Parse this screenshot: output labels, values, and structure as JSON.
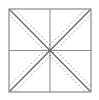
{
  "figure": {
    "canvas": {
      "width": 99,
      "height": 100,
      "background": "#ffffff"
    },
    "colors": {
      "border": "#8a8a8a",
      "center_lines": "#8f8f8f",
      "diagonal_solid": "#6e6e6e",
      "diagonal_dashed": "#9a9a9a",
      "background": "#ffffff"
    },
    "square": {
      "label": "outer-square",
      "x": 9,
      "y": 9,
      "width": 82,
      "height": 83,
      "stroke_width": 1.2
    },
    "center_lines": [
      {
        "label": "vertical-center-line",
        "x1": 50,
        "y1": 9,
        "x2": 50,
        "y2": 92,
        "stroke_width": 1.1
      },
      {
        "label": "horizontal-center-line",
        "x1": 9,
        "y1": 50.5,
        "x2": 91,
        "y2": 50.5,
        "stroke_width": 1.1
      }
    ],
    "diagonals": [
      {
        "label": "main-diagonal",
        "x1": 9,
        "y1": 9,
        "x2": 91,
        "y2": 92,
        "stroke_width": 1.5
      },
      {
        "label": "anti-diagonal",
        "x1": 91,
        "y1": 9,
        "x2": 9,
        "y2": 92,
        "stroke_width": 1.5
      }
    ],
    "dashed_lines": [
      {
        "label": "main-diagonal-dashed-upper",
        "x1": 9,
        "y1": 3.5,
        "x2": 96.5,
        "y2": 92,
        "offset": -5.5,
        "dash": "1.6 2.2",
        "stroke_width": 1.0
      },
      {
        "label": "main-diagonal-dashed-lower",
        "x1": 3.5,
        "y1": 9,
        "x2": 91,
        "y2": 97.5,
        "offset": 5.5,
        "dash": "1.6 2.2",
        "stroke_width": 1.0
      },
      {
        "label": "anti-diagonal-dashed-upper",
        "x1": 91,
        "y1": 3.5,
        "x2": 3.5,
        "y2": 92,
        "offset": -5.5,
        "dash": "1.6 2.2",
        "stroke_width": 1.0
      },
      {
        "label": "anti-diagonal-dashed-lower",
        "x1": 96.5,
        "y1": 9,
        "x2": 9,
        "y2": 97.5,
        "offset": 5.5,
        "dash": "1.6 2.2",
        "stroke_width": 1.0
      }
    ],
    "center_point": {
      "label": "center-intersection",
      "cx": 50,
      "cy": 50.5,
      "r": 1.6
    },
    "clip_region": {
      "x": 9,
      "y": 9,
      "width": 82,
      "height": 83
    }
  }
}
